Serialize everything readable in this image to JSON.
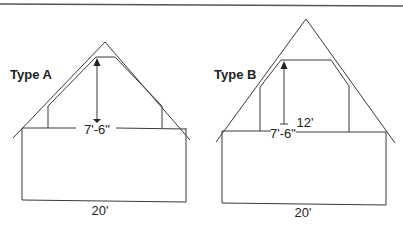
{
  "figure": {
    "colors": {
      "stroke": "#3a3a3a",
      "text": "#222222",
      "background": "#ffffff"
    },
    "diagrams": [
      {
        "id": "type-a",
        "label": "Type A",
        "ceiling_height_label": "7'-6\"",
        "building_width_label": "20'"
      },
      {
        "id": "type-b",
        "label": "Type B",
        "ceiling_height_label": "7'-6\"",
        "room_width_label": "12'",
        "building_width_label": "20'"
      }
    ]
  }
}
